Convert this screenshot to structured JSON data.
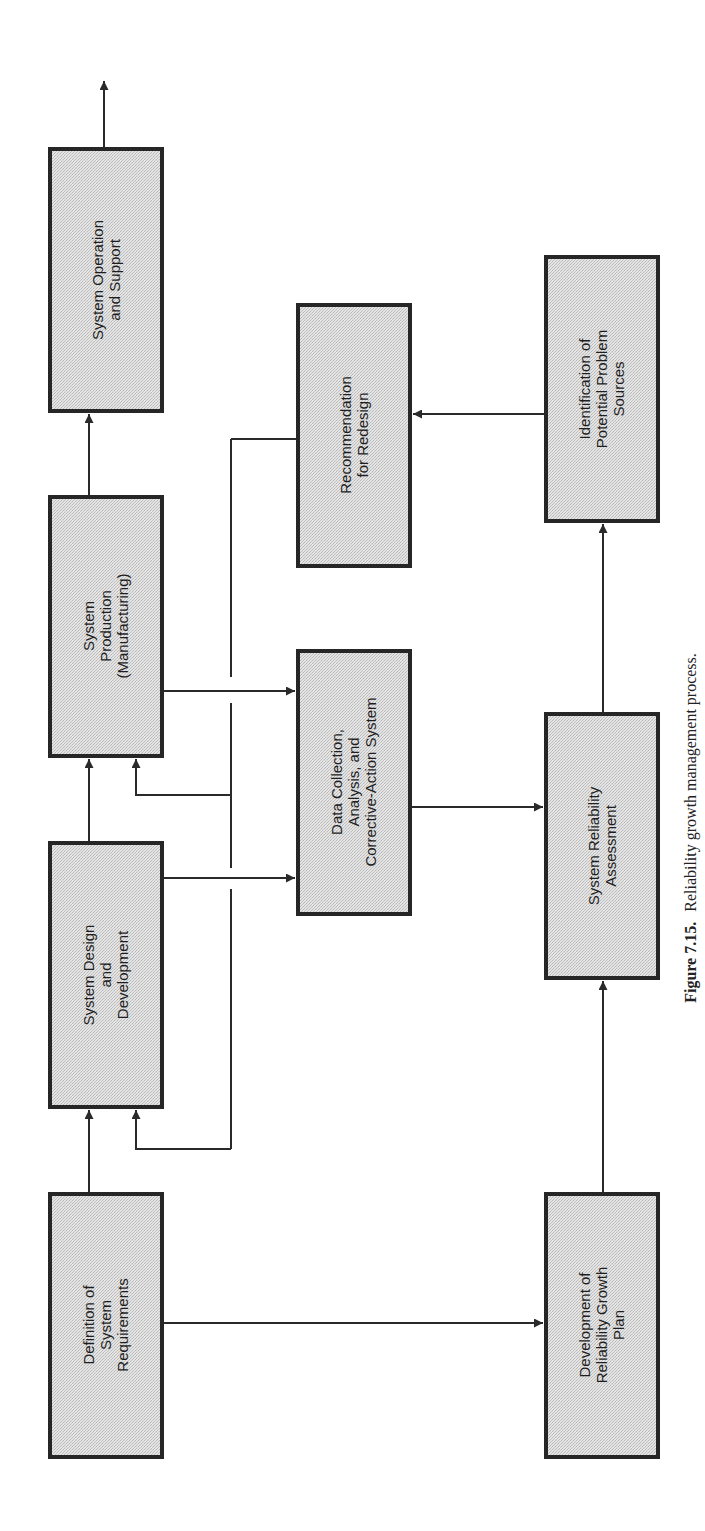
{
  "figure": {
    "caption_label": "Figure 7.15.",
    "caption_text": "Reliability growth management process.",
    "orientation": "rotated 90° counter-clockwise (text reads bottom-to-top)"
  },
  "colors": {
    "box_fill": "#dcdcdc",
    "box_border": "#262626",
    "line": "#2a2a2a",
    "background": "#ffffff"
  },
  "boxes": {
    "definition": {
      "lines": [
        "Definition of",
        "System",
        "Requirements"
      ]
    },
    "design": {
      "lines": [
        "System Design",
        "and",
        "Development"
      ]
    },
    "production": {
      "lines": [
        "System",
        "Production",
        "(Manufacturing)"
      ]
    },
    "operation": {
      "lines": [
        "System Operation",
        "and Support"
      ]
    },
    "data_collection": {
      "lines": [
        "Data Collection,",
        "Analysis, and",
        "Corrective-Action System"
      ]
    },
    "recommendation": {
      "lines": [
        "Recommendation",
        "for Redesign"
      ]
    },
    "growth_plan": {
      "lines": [
        "Development of",
        "Reliability Growth",
        "Plan"
      ]
    },
    "assessment": {
      "lines": [
        "System Reliability",
        "Assessment"
      ]
    },
    "identification": {
      "lines": [
        "Identification of",
        "Potential Problem",
        "Sources"
      ]
    }
  },
  "connections": [
    {
      "from": "definition",
      "to": "design"
    },
    {
      "from": "design",
      "to": "production"
    },
    {
      "from": "production",
      "to": "operation"
    },
    {
      "from": "operation",
      "to": "output"
    },
    {
      "from": "definition",
      "to": "growth_plan"
    },
    {
      "from": "design",
      "to": "data_collection"
    },
    {
      "from": "production",
      "to": "data_collection"
    },
    {
      "from": "data_collection",
      "to": "assessment"
    },
    {
      "from": "growth_plan",
      "to": "assessment"
    },
    {
      "from": "assessment",
      "to": "identification"
    },
    {
      "from": "identification",
      "to": "recommendation"
    },
    {
      "from": "recommendation",
      "to": "design",
      "type": "feedback"
    },
    {
      "from": "recommendation",
      "to": "production",
      "type": "feedback"
    }
  ]
}
